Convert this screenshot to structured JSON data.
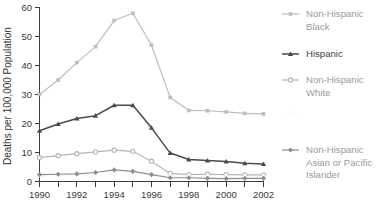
{
  "chart_data": {
    "type": "line",
    "title": "",
    "subtitle": "",
    "xlabel": "",
    "ylabel": "Deaths per 100,000 Population",
    "x": [
      1990,
      1991,
      1992,
      1993,
      1994,
      1995,
      1996,
      1997,
      1998,
      1999,
      2000,
      2001,
      2002
    ],
    "xtick_labels": [
      "1990",
      "1992",
      "1994",
      "1996",
      "1998",
      "2000",
      "2002"
    ],
    "xtick_values": [
      1990,
      1992,
      1994,
      1996,
      1998,
      2000,
      2002
    ],
    "ytick_labels": [
      "0",
      "10",
      "20",
      "30",
      "40",
      "50",
      "60"
    ],
    "ytick_values": [
      0,
      10,
      20,
      30,
      40,
      50,
      60
    ],
    "xlim": [
      1990,
      2002
    ],
    "ylim": [
      0,
      60
    ],
    "grid": false,
    "legend_position": "right",
    "series": [
      {
        "name": "Non-Hispanic Black",
        "marker": "square",
        "color": "#bdbdbd",
        "values": [
          30.0,
          35.0,
          41.0,
          46.5,
          55.5,
          58.0,
          47.0,
          29.0,
          24.5,
          24.4,
          24.0,
          23.5,
          23.3
        ]
      },
      {
        "name": "Hispanic",
        "marker": "triangle",
        "color": "#4a4a4a",
        "values": [
          17.5,
          19.8,
          21.7,
          22.7,
          26.3,
          26.3,
          18.5,
          9.8,
          7.6,
          7.2,
          6.9,
          6.3,
          6.0
        ]
      },
      {
        "name": "Non-Hispanic White",
        "marker": "open-circle",
        "color": "#b5b5b5",
        "values": [
          8.2,
          8.9,
          9.6,
          10.2,
          10.8,
          10.4,
          7.0,
          2.8,
          2.4,
          2.5,
          2.4,
          2.3,
          2.3
        ]
      },
      {
        "name": "",
        "marker": "square",
        "color": "#fafafa",
        "values": [
          2.0,
          2.1,
          2.2,
          2.3,
          2.5,
          2.4,
          2.0,
          1.9,
          1.9,
          1.8,
          1.8,
          1.7,
          1.7
        ]
      },
      {
        "name": "Non-Hispanic Asian or Pacific Islander",
        "marker": "diamond",
        "color": "#8e8e8e",
        "values": [
          2.4,
          2.5,
          2.6,
          3.1,
          4.0,
          3.5,
          2.4,
          1.3,
          1.3,
          1.1,
          1.0,
          1.1,
          1.1
        ]
      }
    ]
  },
  "axes": {
    "y_axis_title": "Deaths per 100,000 Population",
    "y_ticks": [
      "60",
      "50",
      "40",
      "30",
      "20",
      "10",
      "0"
    ],
    "x_ticks": [
      "1990",
      "1992",
      "1994",
      "1996",
      "1998",
      "2000",
      "2002"
    ]
  },
  "legend": {
    "entries": [
      {
        "label_line1": "Non-Hispanic",
        "label_line2": "Black",
        "tone": "light",
        "marker": "square"
      },
      {
        "label_line1": "Hispanic",
        "label_line2": "",
        "tone": "dark",
        "marker": "triangle"
      },
      {
        "label_line1": "Non-Hispanic",
        "label_line2": "White",
        "tone": "light",
        "marker": "open-circle"
      },
      {
        "label_line1": "",
        "label_line2": "",
        "label_line3": "",
        "tone": "ghost",
        "marker": "square"
      },
      {
        "label_line1": "Non-Hispanic",
        "label_line2": "Asian or Pacific",
        "label_line3": "Islander",
        "tone": "light",
        "marker": "diamond"
      }
    ]
  },
  "colors": {
    "axis": "#3d3d3d",
    "light_series": "#bdbdbd",
    "dark_series": "#4a4a4a",
    "mid_series": "#8e8e8e",
    "ghost_series": "#fafafa",
    "background": "#ffffff"
  }
}
